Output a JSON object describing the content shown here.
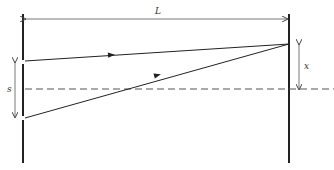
{
  "diagram": {
    "type": "double-slit geometry",
    "labels": {
      "distance": "L",
      "slit_separation": "s",
      "screen_offset": "x"
    },
    "colors": {
      "line": "#222222",
      "dim_arrow": "#555555",
      "dashed_axis": "#555555",
      "background": "#ffffff"
    }
  }
}
